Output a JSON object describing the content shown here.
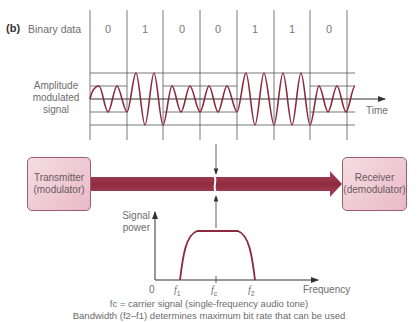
{
  "figure": {
    "part_label": "(b)",
    "binary_data_label": "Binary data",
    "bits": [
      "0",
      "1",
      "0",
      "0",
      "1",
      "1",
      "0"
    ],
    "signal_label_lines": [
      "Amplitude",
      "modulated",
      "signal"
    ],
    "time_label": "Time",
    "transmitter": {
      "line1": "Transmitter",
      "line2": "(modulator)"
    },
    "receiver": {
      "line1": "Receiver",
      "line2": "(demodulator)"
    },
    "spectrum": {
      "ylabel_lines": [
        "Signal",
        "power"
      ],
      "xlabel": "Frequency",
      "origin": "0",
      "f1": "f1",
      "fc": "fc",
      "f2": "f2"
    },
    "caption_line1": "fc = carrier signal (single-frequency audio tone)",
    "caption_line2": "Bandwidth (f2–f1) determines maximum bit rate that can be used",
    "colors": {
      "wave": "#8b2a3e",
      "band": "#9c3346",
      "box_fill": "#efc9d3",
      "grid": "#555555"
    }
  }
}
